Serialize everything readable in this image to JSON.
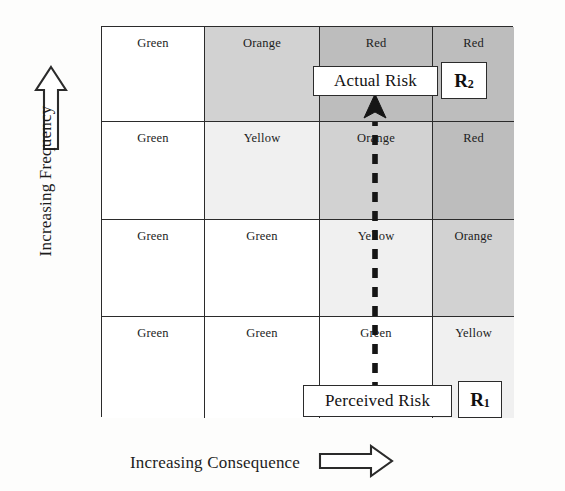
{
  "diagram": {
    "axes": {
      "y_label": "Increasing Frequency",
      "y_arrow_icon": "arrow-up-outline-icon",
      "x_label": "Increasing Consequence",
      "x_arrow_icon": "arrow-right-outline-icon"
    },
    "matrix": {
      "columns": 4,
      "rows": 4,
      "rows_top_to_bottom": [
        {
          "cells": [
            {
              "label": "Green",
              "shade": 0
            },
            {
              "label": "Orange",
              "shade": 3
            },
            {
              "label": "Red",
              "shade": 4
            },
            {
              "label": "Red",
              "shade": 4
            }
          ]
        },
        {
          "cells": [
            {
              "label": "Green",
              "shade": 0
            },
            {
              "label": "Yellow",
              "shade": 1
            },
            {
              "label": "Orange",
              "shade": 3
            },
            {
              "label": "Red",
              "shade": 4
            }
          ]
        },
        {
          "cells": [
            {
              "label": "Green",
              "shade": 0
            },
            {
              "label": "Green",
              "shade": 0
            },
            {
              "label": "Yellow",
              "shade": 1
            },
            {
              "label": "Orange",
              "shade": 3
            }
          ]
        },
        {
          "cells": [
            {
              "label": "Green",
              "shade": 0
            },
            {
              "label": "Green",
              "shade": 0
            },
            {
              "label": "Green",
              "shade": 0
            },
            {
              "label": "Yellow",
              "shade": 1
            }
          ]
        }
      ]
    },
    "annotations": {
      "actual_risk_label": "Actual Risk",
      "actual_risk_tag": "R",
      "actual_risk_tag_subscript": "2",
      "perceived_risk_label": "Perceived Risk",
      "perceived_risk_tag": "R",
      "perceived_risk_tag_subscript": "1",
      "trend_arrow_icon": "dashed-arrow-up-icon"
    },
    "colors": {
      "ink": "#2b2b2b",
      "shade_white": "#ffffff",
      "shade_light": "#f0f0f0",
      "shade_mid": "#e2e2e2",
      "shade_dark": "#d2d2d2",
      "shade_darkest": "#bdbdbd"
    }
  }
}
